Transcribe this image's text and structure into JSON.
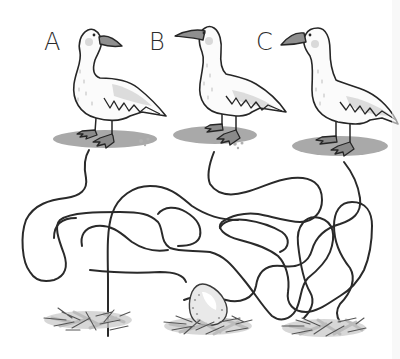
{
  "puzzle": {
    "type": "maze",
    "description": "Which goose laid the egg? Follow the lines from each goose to a nest.",
    "geese": [
      {
        "id": "A",
        "label": "A",
        "facing": "right"
      },
      {
        "id": "B",
        "label": "B",
        "facing": "left"
      },
      {
        "id": "C",
        "label": "C",
        "facing": "left"
      }
    ],
    "nests": [
      {
        "position": "left",
        "has_egg": false
      },
      {
        "position": "middle",
        "has_egg": true
      },
      {
        "position": "right",
        "has_egg": false
      }
    ],
    "colors": {
      "line": "#2a2a2a",
      "shadow": "#a9a9a9",
      "beak": "#8f8f8f",
      "background": "#ffffff"
    }
  }
}
